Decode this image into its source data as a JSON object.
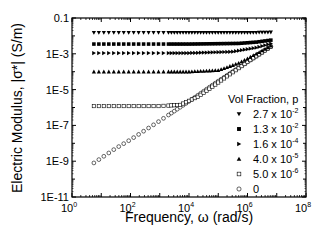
{
  "chart_data": {
    "type": "scatter",
    "title": "",
    "xlabel": "Frequency, ω (rad/s)",
    "ylabel": "Electric Modulus, |σ*| (S/m)",
    "xscale": "log",
    "yscale": "log",
    "xlim": [
      1,
      100000000
    ],
    "ylim": [
      1e-11,
      0.1
    ],
    "x_ticks": [
      "10^0",
      "10^2",
      "10^4",
      "10^6",
      "10^8"
    ],
    "y_ticks": [
      "0.1",
      "1E-3",
      "1E-5",
      "1E-7",
      "1E-9",
      "1E-11"
    ],
    "grid": false,
    "legend": {
      "title": "Vol Fraction, p",
      "position": "lower right inside"
    },
    "x_range_of_data": [
      5.6,
      7400000
    ],
    "series": [
      {
        "name": "2.7 x 10^-2",
        "marker": "triangle-down",
        "filled": true,
        "points": [
          [
            5.6,
            0.015
          ],
          [
            100,
            0.015
          ],
          [
            10000,
            0.015
          ],
          [
            1000000,
            0.015
          ],
          [
            7400000,
            0.016
          ]
        ]
      },
      {
        "name": "1.3 x 10^-2",
        "marker": "square",
        "filled": true,
        "points": [
          [
            5.6,
            0.0035
          ],
          [
            100,
            0.0035
          ],
          [
            10000,
            0.0035
          ],
          [
            500000,
            0.0038
          ],
          [
            2000000,
            0.0045
          ],
          [
            7400000,
            0.006
          ]
        ]
      },
      {
        "name": "1.6 x 10^-4",
        "marker": "triangle-right",
        "filled": true,
        "points": [
          [
            5.6,
            0.0011
          ],
          [
            100,
            0.0011
          ],
          [
            10000,
            0.0011
          ],
          [
            300000,
            0.0013
          ],
          [
            2000000,
            0.0022
          ],
          [
            7400000,
            0.004
          ]
        ]
      },
      {
        "name": "4.0 x 10^-5",
        "marker": "triangle-up",
        "filled": true,
        "points": [
          [
            5.6,
            0.0001
          ],
          [
            100,
            0.0001
          ],
          [
            10000,
            0.0001
          ],
          [
            100000,
            0.00012
          ],
          [
            500000,
            0.0003
          ],
          [
            2000000,
            0.001
          ],
          [
            7400000,
            0.0032
          ]
        ]
      },
      {
        "name": "5.0 x 10^-6",
        "marker": "square",
        "filled": false,
        "points": [
          [
            5.6,
            1.2e-06
          ],
          [
            100,
            1.2e-06
          ],
          [
            1000,
            1.2e-06
          ],
          [
            5000,
            1.4e-06
          ],
          [
            20000,
            4e-06
          ],
          [
            100000,
            2.5e-05
          ],
          [
            1000000,
            0.00035
          ],
          [
            7400000,
            0.003
          ]
        ]
      },
      {
        "name": "0",
        "marker": "circle",
        "filled": false,
        "points": [
          [
            5.6,
            8e-10
          ],
          [
            30,
            5e-09
          ],
          [
            100,
            1.6e-08
          ],
          [
            1000,
            1.8e-07
          ],
          [
            10000,
            2.2e-06
          ],
          [
            100000,
            3e-05
          ],
          [
            1000000,
            0.00035
          ],
          [
            7400000,
            0.003
          ]
        ]
      }
    ]
  },
  "axes": {
    "xlabel": "Frequency, ω (rad/s)",
    "ylabel": "Electric Modulus, |σ*| (S/m)",
    "y_ticks": [
      "0.1",
      "1E-3",
      "1E-5",
      "1E-7",
      "1E-9",
      "1E-11"
    ],
    "x_ticks": [
      {
        "base": "10",
        "exp": "0"
      },
      {
        "base": "10",
        "exp": "2"
      },
      {
        "base": "10",
        "exp": "4"
      },
      {
        "base": "10",
        "exp": "6"
      },
      {
        "base": "10",
        "exp": "8"
      }
    ]
  },
  "legend": {
    "title": "Vol Fraction, p",
    "entries": [
      {
        "mantissa": "2.7 x 10",
        "exp": "-2",
        "marker": "triangle-down"
      },
      {
        "mantissa": "1.3 x 10",
        "exp": "-2",
        "marker": "square-filled"
      },
      {
        "mantissa": "1.6 x 10",
        "exp": "-4",
        "marker": "triangle-right"
      },
      {
        "mantissa": "4.0 x 10",
        "exp": "-5",
        "marker": "triangle-up"
      },
      {
        "mantissa": "5.0 x 10",
        "exp": "-6",
        "marker": "square-open"
      },
      {
        "mantissa": "0",
        "exp": "",
        "marker": "circle-open"
      }
    ]
  }
}
